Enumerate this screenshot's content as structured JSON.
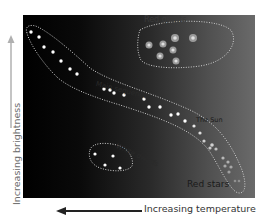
{
  "diagram": {
    "y_axis": {
      "label": "Increasing brightness",
      "arrow_direction": "up",
      "arrow_color": "#b0b0b0"
    },
    "x_axis": {
      "label": "Increasing temperature",
      "arrow_direction": "left",
      "arrow_color": "#222222"
    },
    "regions": [
      {
        "name": "Red giants",
        "label": "Red giants",
        "label_color": "#3a3a3a"
      },
      {
        "name": "Main sequence",
        "label": "Main sequence",
        "label_color": "#2a2a2a"
      },
      {
        "name": "White dwarfs",
        "label": "White dwarfs",
        "label_color": "#2a2a2a"
      }
    ],
    "annotations": {
      "sun": "The Sun",
      "red_stars": "Red stars"
    },
    "colors": {
      "panel_left": "#000000",
      "panel_right": "#6a6a6a",
      "star_white": "#ffffff",
      "star_red_giant": "#c8c8c8",
      "outline": "#cfcfcf"
    }
  }
}
